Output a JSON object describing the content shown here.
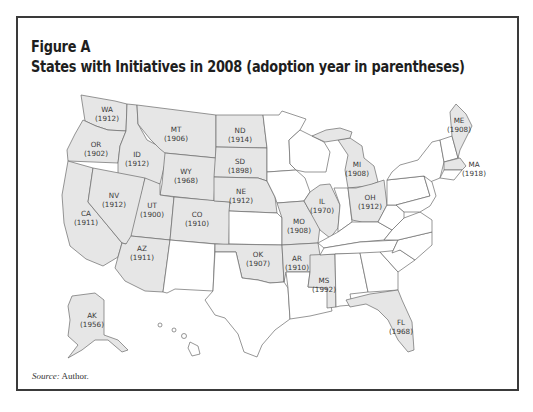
{
  "figure": {
    "label": "Figure A",
    "title": "States with Initiatives in 2008 (adoption year in parentheses)",
    "source_prefix": "Source:",
    "source_text": " Author."
  },
  "legend": {
    "shaded_meaning": "State has initiative process (2008)",
    "shaded_color": "#e6e6e6",
    "unshaded_color": "#ffffff"
  },
  "states": [
    {
      "abbr": "WA",
      "year": "(1912)"
    },
    {
      "abbr": "OR",
      "year": "(1902)"
    },
    {
      "abbr": "CA",
      "year": "(1911)"
    },
    {
      "abbr": "ID",
      "year": "(1912)"
    },
    {
      "abbr": "NV",
      "year": "(1912)"
    },
    {
      "abbr": "MT",
      "year": "(1906)"
    },
    {
      "abbr": "WY",
      "year": "(1968)"
    },
    {
      "abbr": "UT",
      "year": "(1900)"
    },
    {
      "abbr": "CO",
      "year": "(1910)"
    },
    {
      "abbr": "AZ",
      "year": "(1911)"
    },
    {
      "abbr": "ND",
      "year": "(1914)"
    },
    {
      "abbr": "SD",
      "year": "(1898)"
    },
    {
      "abbr": "NE",
      "year": "(1912)"
    },
    {
      "abbr": "OK",
      "year": "(1907)"
    },
    {
      "abbr": "MO",
      "year": "(1908)"
    },
    {
      "abbr": "AR",
      "year": "(1910)"
    },
    {
      "abbr": "MS",
      "year": "(1992)"
    },
    {
      "abbr": "IL",
      "year": "(1970)"
    },
    {
      "abbr": "MI",
      "year": "(1908)"
    },
    {
      "abbr": "OH",
      "year": "(1912)"
    },
    {
      "abbr": "ME",
      "year": "(1908)"
    },
    {
      "abbr": "MA",
      "year": "(1918)"
    },
    {
      "abbr": "FL",
      "year": "(1968)"
    },
    {
      "abbr": "AK",
      "year": "(1956)"
    }
  ]
}
